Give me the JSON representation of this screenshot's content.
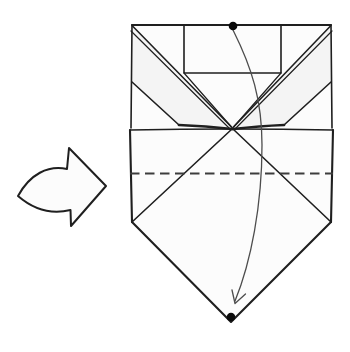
{
  "diagram": {
    "kind": "origami-step-diagram",
    "step_arrow": "hollow curved arrow pointing right",
    "model": "folded paper: top pocket, two corner flaps folded to center, lower diamond giving pentagon bottom",
    "valley_fold": "horizontal dashed fold line across lower square",
    "motion_arrow": "thin curved arrow from top dot down to bottom dot",
    "reference_dots": 2
  },
  "colors": {
    "background": "#ffffff",
    "line": "#1f1f1f",
    "paper": "#fcfcfc",
    "shade": "#f4f4f4",
    "dash": "#3d3d3d",
    "motion": "#4d4d4d",
    "dot": "#0a0a0a"
  }
}
